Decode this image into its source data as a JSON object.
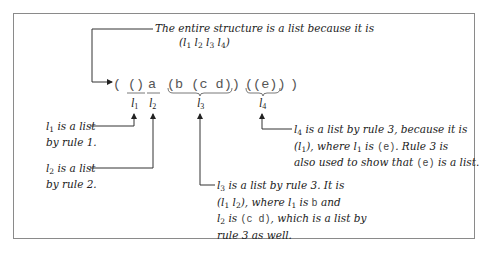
{
  "diagram": {
    "title_note": {
      "line1": "The entire structure is a list because it is",
      "line2_parts": [
        "(l",
        "1",
        " l",
        "2",
        " l",
        "3",
        " l",
        "4",
        ")"
      ]
    },
    "expression": {
      "open": "(",
      "items": [
        "()",
        "a",
        "(b (c d))",
        "((e))"
      ],
      "close": ")"
    },
    "labels": [
      {
        "var": "l",
        "sub": "1"
      },
      {
        "var": "l",
        "sub": "2"
      },
      {
        "var": "l",
        "sub": "3"
      },
      {
        "var": "l",
        "sub": "4"
      }
    ],
    "notes": {
      "l1": {
        "sub": "1",
        "line1_rest": " is a list",
        "line2": "by rule 1."
      },
      "l2": {
        "sub": "2",
        "line1_rest": " is a list",
        "line2": "by rule 2."
      },
      "l3": {
        "sub": "3",
        "line1_rest": " is a list by rule 3.  It is",
        "line2": "(l1 l2), where l1 is b and",
        "line3": "l2 is (c d), which is a list by",
        "line4": "rule 3 as well."
      },
      "l4": {
        "sub": "4",
        "line1_rest": " is a list by rule 3, because it is",
        "line2": "(l1), where l1 is (e).  Rule 3 is",
        "line3": "also used to show that (e) is a list."
      }
    },
    "code_tokens": {
      "b": "b",
      "cd": "(c  d)",
      "e": "(e)"
    },
    "colors": {
      "line": "#333333",
      "frame": "#8a8a8a",
      "text": "#222222"
    }
  }
}
